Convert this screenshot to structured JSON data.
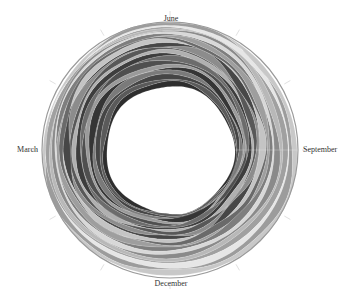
{
  "chart_data": {
    "type": "area",
    "subtype": "radial-streamgraph",
    "title": "",
    "angular_axis": {
      "categories": [
        "January",
        "February",
        "March",
        "April",
        "May",
        "June",
        "July",
        "August",
        "September",
        "October",
        "November",
        "December"
      ],
      "labeled": [
        {
          "label": "June",
          "position": "top"
        },
        {
          "label": "September",
          "position": "right"
        },
        {
          "label": "December",
          "position": "bottom"
        },
        {
          "label": "March",
          "position": "left"
        }
      ],
      "tick_count": 12
    },
    "geometry": {
      "center": [
        170,
        150
      ],
      "inner_radius": 63,
      "outer_radius": 128
    },
    "legend": "none",
    "grid": false,
    "color_scheme": "grayscale",
    "series_count": 24
  },
  "labels": {
    "june": "June",
    "september": "September",
    "december": "December",
    "march": "March"
  },
  "colors": {
    "background": "#ffffff",
    "dark": "#3a3a3a",
    "mid": "#8a8a8a",
    "light": "#d6d6d6",
    "tick": "#d8d8d8",
    "label": "#333333"
  }
}
